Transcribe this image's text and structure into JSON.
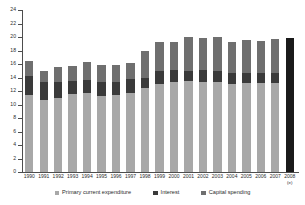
{
  "chart_data": {
    "type": "bar",
    "stacked": true,
    "title": "",
    "subtitle": "",
    "xlabel": "",
    "ylabel": "",
    "ylim": [
      0,
      24
    ],
    "ytick_step": 2,
    "yticks": [
      "0",
      "2",
      "4",
      "6",
      "8",
      "10",
      "12",
      "14",
      "16",
      "18",
      "20",
      "22",
      "24"
    ],
    "grid": false,
    "legend_position": "bottom",
    "categories": [
      "1990",
      "1991",
      "1992",
      "1993",
      "1994",
      "1995",
      "1996",
      "1997",
      "1998",
      "1999",
      "2000",
      "2001",
      "2002",
      "2003",
      "2004",
      "2005",
      "2006",
      "2007",
      "2008"
    ],
    "category_notes": {
      "2008": "(e)"
    },
    "series": [
      {
        "name": "Primary current expenditure",
        "color": "#a8a8a8",
        "values": [
          11.4,
          10.7,
          11.0,
          11.5,
          11.7,
          11.2,
          11.4,
          11.7,
          12.4,
          13.0,
          13.3,
          13.5,
          13.3,
          13.3,
          13.0,
          13.2,
          13.2,
          13.2,
          null
        ]
      },
      {
        "name": "Interest",
        "color": "#3a3a3a",
        "values": [
          2.8,
          2.6,
          2.4,
          2.0,
          2.0,
          2.2,
          2.0,
          2.1,
          1.6,
          1.9,
          1.8,
          1.5,
          1.8,
          1.7,
          1.6,
          1.5,
          1.4,
          1.4,
          null
        ]
      },
      {
        "name": "Capital spending",
        "color": "#6f6f6f",
        "values": [
          2.3,
          1.7,
          2.2,
          2.2,
          2.6,
          2.5,
          2.5,
          2.4,
          4.0,
          4.3,
          4.1,
          5.0,
          4.7,
          5.0,
          4.6,
          4.9,
          4.8,
          5.1,
          null
        ]
      },
      {
        "name": "2008 estimate total",
        "color": "#1a1a1a",
        "values": [
          null,
          null,
          null,
          null,
          null,
          null,
          null,
          null,
          null,
          null,
          null,
          null,
          null,
          null,
          null,
          null,
          null,
          null,
          19.8
        ]
      }
    ],
    "totals": [
      16.5,
      15.0,
      16.5,
      16.6,
      17.1,
      16.9,
      16.8,
      17.2,
      18.0,
      19.2,
      19.2,
      20.0,
      19.8,
      20.1,
      19.2,
      19.6,
      19.4,
      19.7,
      19.8
    ]
  },
  "legend": {
    "items": [
      {
        "label": "Primary current expenditure",
        "color": "#a8a8a8"
      },
      {
        "label": "Interest",
        "color": "#3a3a3a"
      },
      {
        "label": "Capital spending",
        "color": "#6f6f6f"
      }
    ]
  }
}
